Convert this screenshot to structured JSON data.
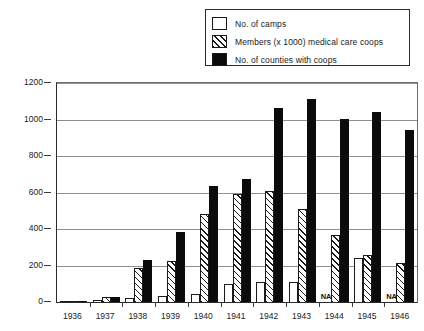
{
  "legend": {
    "items": [
      {
        "label": "No. of camps",
        "style": "open",
        "icon": "legend-swatch-open"
      },
      {
        "label": "Members (x 1000) medical care coops",
        "style": "hatched",
        "icon": "legend-swatch-hatched"
      },
      {
        "label": "No. of counties with coops",
        "style": "solid",
        "icon": "legend-swatch-solid"
      }
    ]
  },
  "axis": {
    "y_ticks": [
      "1200",
      "1000",
      "800",
      "600",
      "400",
      "200",
      "0"
    ],
    "x_ticks": [
      "1936",
      "1937",
      "1938",
      "1939",
      "1940",
      "1941",
      "1942",
      "1943",
      "1944",
      "1945",
      "1946"
    ]
  },
  "na_marker": "NA",
  "colors": {
    "solid_bar": "#0b0b0b",
    "open_bar": "#ffffff",
    "outline": "#1a1a1a",
    "gridline": "#8f8f8f",
    "axis": "#2b2b2b",
    "background": "#ffffff"
  },
  "chart_data": {
    "type": "bar",
    "title": "",
    "subtitle": "",
    "xlabel": "",
    "ylabel": "",
    "ylim": [
      0,
      1200
    ],
    "ytick_step": 200,
    "grid": true,
    "legend_position": "top-right",
    "categories": [
      "1936",
      "1937",
      "1938",
      "1939",
      "1940",
      "1941",
      "1942",
      "1943",
      "1944",
      "1945",
      "1946"
    ],
    "series": [
      {
        "name": "No. of camps",
        "style": "open",
        "values": [
          3,
          12,
          20,
          35,
          45,
          100,
          110,
          110,
          null,
          240,
          null
        ],
        "missing_label": "NA",
        "missing_years": [
          "1944",
          "1946"
        ]
      },
      {
        "name": "Members (x 1000) medical care coops",
        "style": "hatched",
        "values": [
          0,
          25,
          185,
          225,
          480,
          590,
          610,
          510,
          365,
          255,
          215
        ]
      },
      {
        "name": "No. of counties with coops",
        "style": "solid",
        "values": [
          8,
          30,
          230,
          385,
          635,
          675,
          1065,
          1110,
          1005,
          1040,
          940
        ]
      }
    ]
  }
}
